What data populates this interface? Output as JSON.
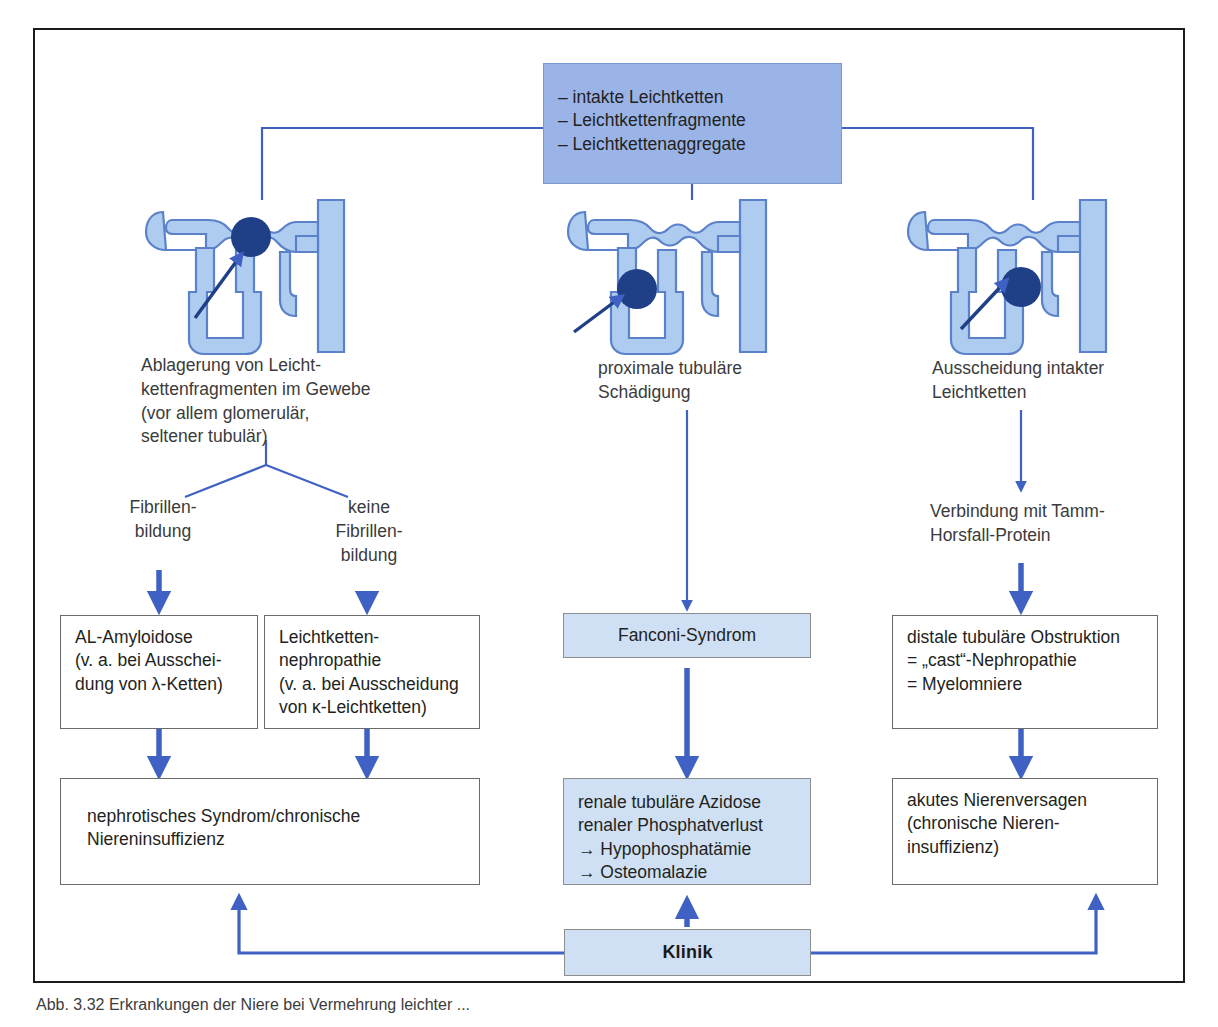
{
  "figure": {
    "caption": "Abb. 3.32   Erkrankungen der Niere bei Vermehrung leichter ..."
  },
  "top_box": {
    "lines": "– intakte Leichtketten\n– Leichtkettenfragmente\n– Leichtkettenaggregate"
  },
  "columns": [
    {
      "id": "left",
      "nephron_label": "nephron-diagram-left",
      "mechanism": "Ablagerung von Leicht-\nkettenfragmenten im Gewebe\n(vor allem glomerulär,\nseltener tubulär)",
      "branches": [
        {
          "label": "Fibrillen-\nbildung"
        },
        {
          "label": "keine\nFibrillen-\nbildung"
        }
      ],
      "result_boxes": [
        {
          "text": "AL-Amyloidose\n(v. a. bei Ausschei-\ndung von λ-Ketten)"
        },
        {
          "text": "Leichtketten-\nnephropathie\n(v. a. bei Ausscheidung\nvon κ-Leichtketten)"
        }
      ],
      "outcome": "nephrotisches Syndrom/chronische\nNiereninsuffizienz"
    },
    {
      "id": "middle",
      "nephron_label": "nephron-diagram-middle",
      "mechanism": "proximale tubuläre\nSchädigung",
      "intermediate": "Fanconi-Syndrom",
      "outcome": "renale tubuläre Azidose\nrenaler Phosphatverlust\n→ Hypophosphatämie\n→ Osteomalazie"
    },
    {
      "id": "right",
      "nephron_label": "nephron-diagram-right",
      "mechanism": "Ausscheidung intakter\nLeichtketten",
      "link_label": "Verbindung mit Tamm-\nHorsfall-Protein",
      "intermediate": "distale tubuläre Obstruktion\n= „cast“-Nephropathie\n= Myelomniere",
      "outcome": "akutes Nierenversagen\n(chronische Nieren-\ninsuffizienz)"
    }
  ],
  "klinik": {
    "label": "Klinik"
  },
  "colors": {
    "box_fill_dark": "#9ab4e8",
    "box_fill_light": "#cfe0f4",
    "connector": "#3f61c4",
    "nephron_fill": "#aecbf0",
    "nephron_stroke": "#5b82c8",
    "marker": "#1f3f87",
    "frame": "#1b1b1b",
    "text": "#231f20"
  }
}
